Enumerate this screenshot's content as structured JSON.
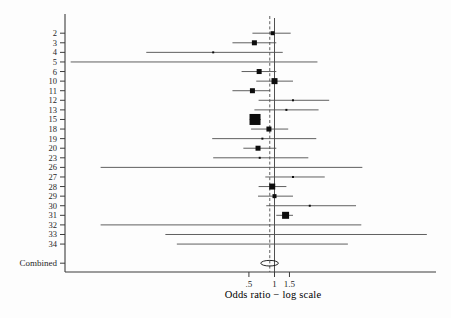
{
  "chart_data": {
    "type": "forest",
    "title": "",
    "xlabel": "Odds ratio − log scale",
    "x_scale": "log",
    "x_ticks": [
      {
        "value": 0.5,
        "label": ".5"
      },
      {
        "value": 1,
        "label": "1"
      },
      {
        "value": 1.5,
        "label": "1.5"
      }
    ],
    "reference_line_or": 1.0,
    "pooled_dashed_line_or": 0.88,
    "studies": [
      {
        "label": "2",
        "or": 0.95,
        "ci_low": 0.55,
        "ci_high": 1.55,
        "weight": 4
      },
      {
        "label": "3",
        "or": 0.58,
        "ci_low": 0.32,
        "ci_high": 1.05,
        "weight": 5
      },
      {
        "label": "4",
        "or": 0.19,
        "ci_low": 0.031,
        "ci_high": 1.25,
        "weight": 2
      },
      {
        "label": "5",
        "or": null,
        "ci_low": 0.004,
        "ci_high": 3.2,
        "weight": 0
      },
      {
        "label": "6",
        "or": 0.66,
        "ci_low": 0.41,
        "ci_high": 1.05,
        "weight": 5
      },
      {
        "label": "10",
        "or": 1.0,
        "ci_low": 0.61,
        "ci_high": 1.65,
        "weight": 6
      },
      {
        "label": "11",
        "or": 0.55,
        "ci_low": 0.32,
        "ci_high": 0.89,
        "weight": 5
      },
      {
        "label": "12",
        "or": 1.65,
        "ci_low": 0.65,
        "ci_high": 4.4,
        "weight": 2
      },
      {
        "label": "13",
        "or": 1.38,
        "ci_low": 0.58,
        "ci_high": 3.3,
        "weight": 2
      },
      {
        "label": "15",
        "or": 0.59,
        "ci_low": 0.51,
        "ci_high": 0.69,
        "weight": 11
      },
      {
        "label": "18",
        "or": 0.86,
        "ci_low": 0.53,
        "ci_high": 1.45,
        "weight": 5
      },
      {
        "label": "19",
        "or": 0.72,
        "ci_low": 0.185,
        "ci_high": 3.1,
        "weight": 2
      },
      {
        "label": "20",
        "or": 0.64,
        "ci_low": 0.43,
        "ci_high": 1.05,
        "weight": 5
      },
      {
        "label": "23",
        "or": 0.67,
        "ci_low": 0.19,
        "ci_high": 2.5,
        "weight": 2
      },
      {
        "label": "26",
        "or": null,
        "ci_low": 0.009,
        "ci_high": 10.8,
        "weight": 0
      },
      {
        "label": "27",
        "or": 1.65,
        "ci_low": 0.78,
        "ci_high": 3.9,
        "weight": 2
      },
      {
        "label": "28",
        "or": 0.94,
        "ci_low": 0.65,
        "ci_high": 1.38,
        "weight": 6
      },
      {
        "label": "29",
        "or": 1.0,
        "ci_low": 0.64,
        "ci_high": 1.65,
        "weight": 4
      },
      {
        "label": "30",
        "or": 2.6,
        "ci_low": 0.8,
        "ci_high": 9.1,
        "weight": 2
      },
      {
        "label": "31",
        "or": 1.35,
        "ci_low": 1.05,
        "ci_high": 1.65,
        "weight": 7
      },
      {
        "label": "32",
        "or": null,
        "ci_low": 0.009,
        "ci_high": 10.5,
        "weight": 0
      },
      {
        "label": "33",
        "or": null,
        "ci_low": 0.052,
        "ci_high": 62,
        "weight": 0
      },
      {
        "label": "34",
        "or": null,
        "ci_low": 0.071,
        "ci_high": 7.3,
        "weight": 0
      }
    ],
    "combined": {
      "label": "Combined",
      "or": 0.88,
      "ci_low": 0.69,
      "ci_high": 1.11
    }
  },
  "colors": {
    "background": "#fdfdfd",
    "axis": "#3c3c3c",
    "ci_line": "#4e4e4e",
    "marker": "#0d0d0d",
    "text": "#1f1f1f"
  }
}
